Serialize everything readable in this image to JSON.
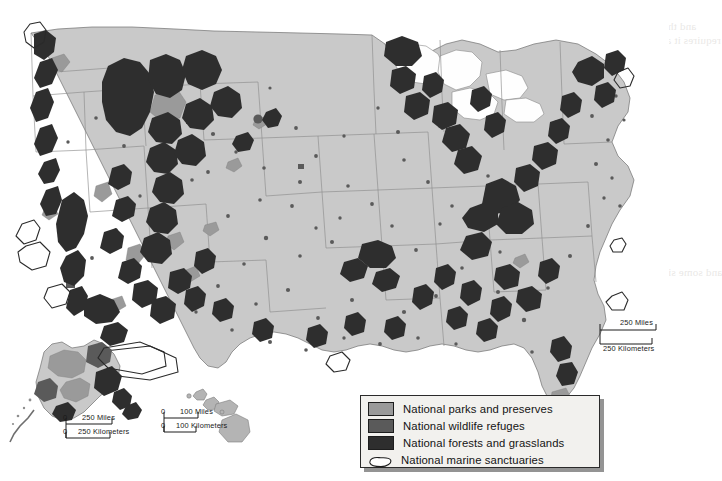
{
  "figure": {
    "kind": "thematic-map",
    "background_color": "#ffffff",
    "land_color": "#c9c9c9",
    "water_color": "#fefefe",
    "boundary_color": "#8a8a8a"
  },
  "legend": {
    "title": "",
    "background_color": "#f2f1ee",
    "border_color": "#2a2a2a",
    "items": [
      {
        "label": "National parks and preserves",
        "swatch_color": "#9a9a9a",
        "symbol": "filled-square"
      },
      {
        "label": "National wildlife refuges",
        "swatch_color": "#5a5a5a",
        "symbol": "filled-square"
      },
      {
        "label": "National forests and grasslands",
        "swatch_color": "#2e2e2e",
        "symbol": "filled-square"
      },
      {
        "label": "National marine sanctuaries",
        "swatch_color": "#ffffff",
        "symbol": "outlined-blob"
      }
    ]
  },
  "scale_bars": [
    {
      "id": "conus",
      "zero_label": "",
      "miles_label": "250 Miles",
      "km_label": "250 Kilometers",
      "miles_value": 250,
      "kilometers_value": 250
    },
    {
      "id": "alaska",
      "zero_label": "0",
      "miles_label": "250 Miles",
      "km_label": "250 Kilometers",
      "miles_value": 250,
      "kilometers_value": 250
    },
    {
      "id": "hawaii",
      "zero_label": "0",
      "miles_label": "100 Miles",
      "km_label": "100 Kilometers",
      "miles_value": 100,
      "kilometers_value": 100
    }
  ],
  "insets": [
    {
      "name": "alaska",
      "label": ""
    },
    {
      "name": "hawaii",
      "label": ""
    }
  ],
  "bleed_text": {
    "lines": [
      "Whereas MA ratios as limited to the carrying capacity in an",
      "subdivided and leased to",
      "and the sentence on a single rectangular area unit",
      "requires it a year of view, is restricted by baseline data",
      "that provides limited",
      "If the land were",
      "levels to identify the",
      "areas will tend to",
      "subdivided with and",
      "hunting. (The ref",
      "politics and toward",
      "Whereas the limits on single",
      "that provides limited",
      "to recognize the need for",
      "and some sites are more defined by the subsequent and"
    ]
  }
}
